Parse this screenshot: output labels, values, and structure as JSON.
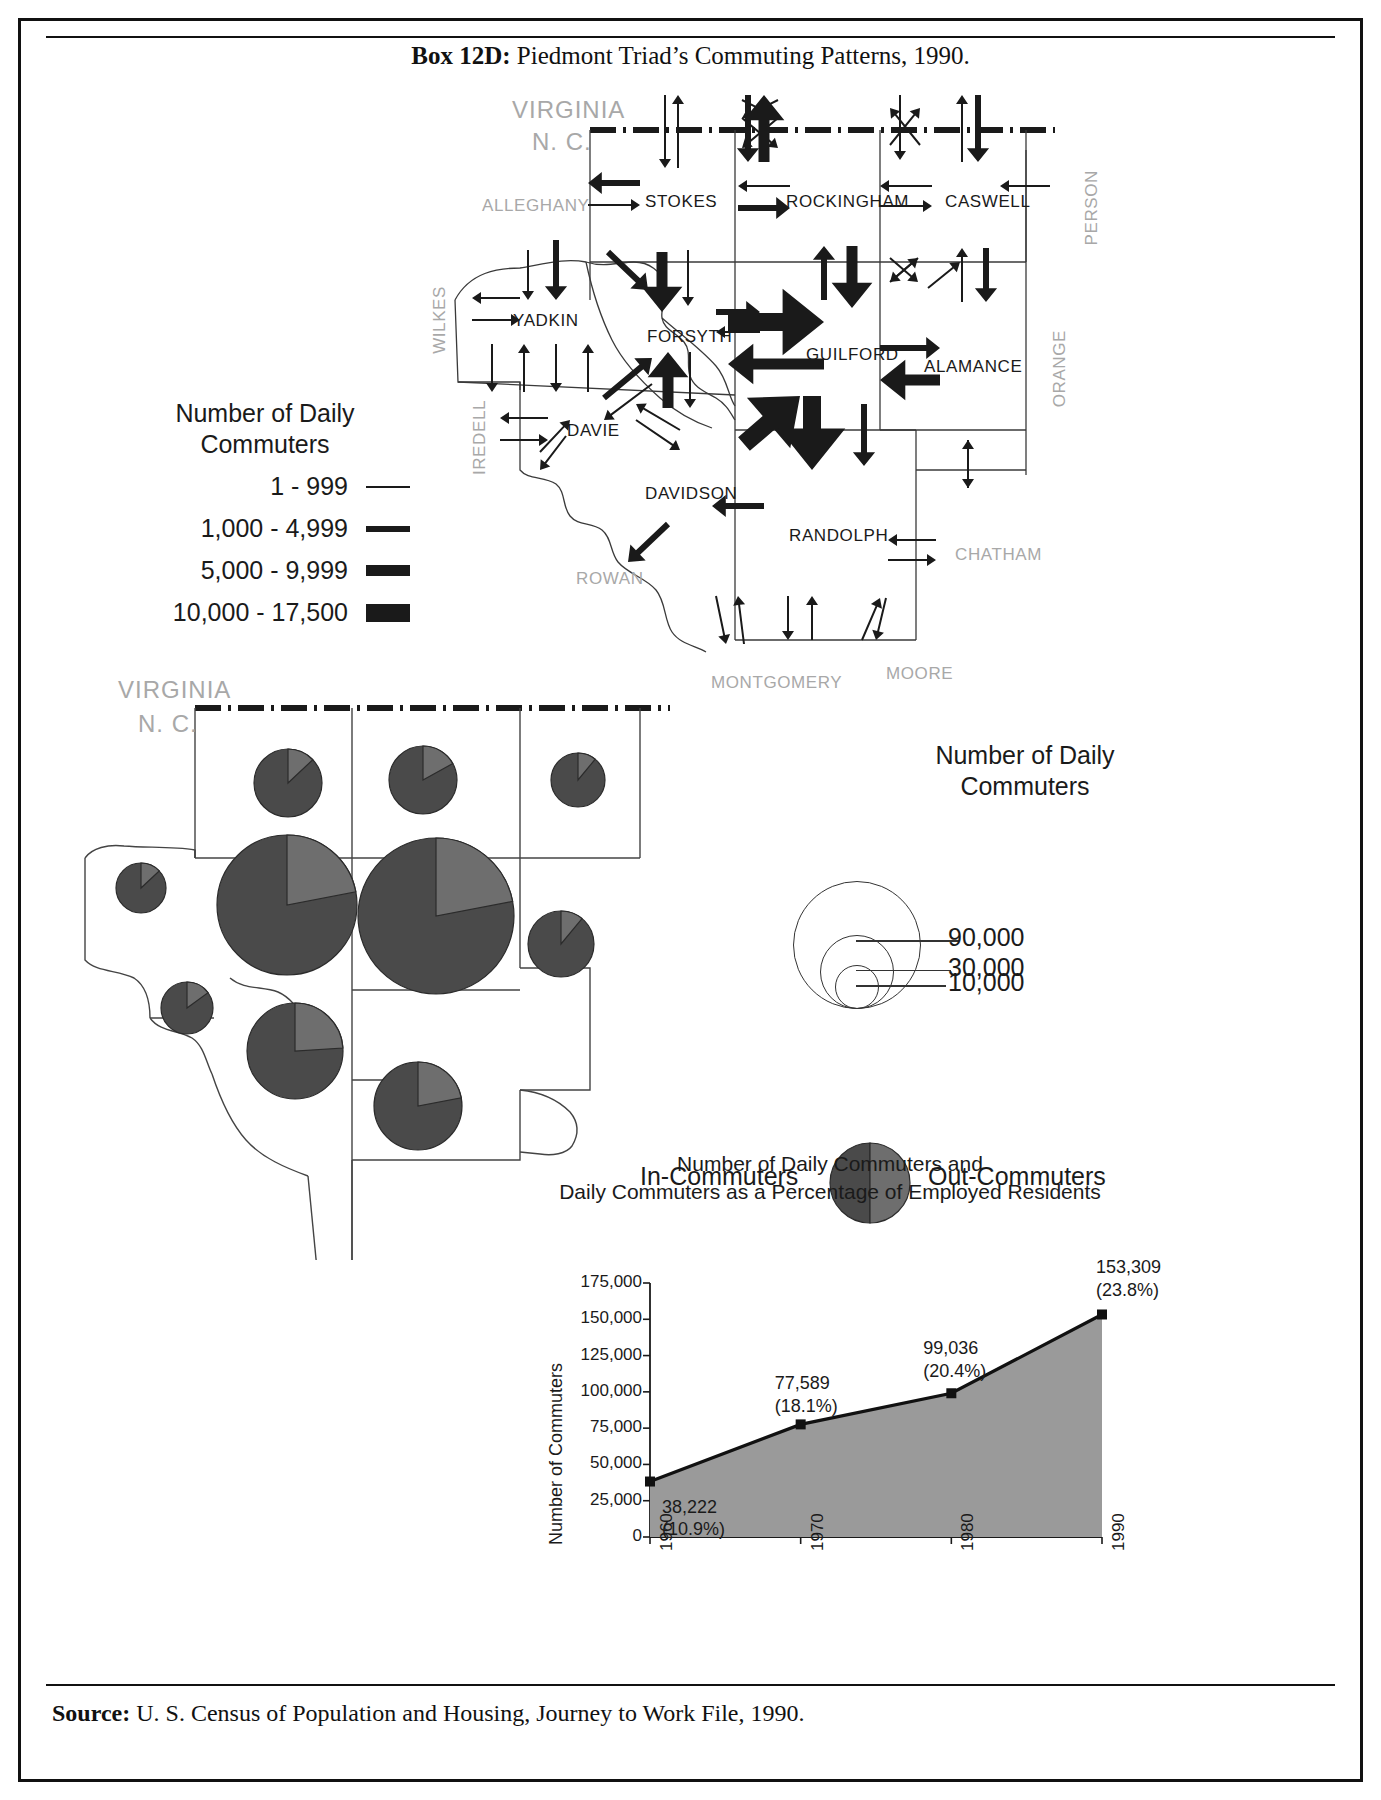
{
  "box": {
    "label": "Box 12D:",
    "title": " Piedmont Triad’s Commuting Patterns, 1990.",
    "source_label": "Source:",
    "source_text": " U. S. Census of Population and Housing, Journey to Work File, 1990."
  },
  "colors": {
    "ink": "#1a1a1a",
    "outside_county": "#a8a8a8",
    "pie_in": "#4a4a4a",
    "pie_out": "#6e6e6e",
    "area_fill": "#9a9a9a"
  },
  "flow_legend": {
    "title_line1": "Number of Daily",
    "title_line2": "Commuters",
    "classes": [
      {
        "label": "1 - 999",
        "weight_px": 2
      },
      {
        "label": "1,000 - 4,999",
        "weight_px": 6
      },
      {
        "label": "5,000 - 9,999",
        "weight_px": 11
      },
      {
        "label": "10,000 - 17,500",
        "weight_px": 18
      }
    ]
  },
  "flow_map": {
    "state_labels": {
      "above": "VIRGINIA",
      "below": "N. C."
    },
    "triad_counties": [
      {
        "name": "STOKES",
        "x": 645,
        "y": 192
      },
      {
        "name": "ROCKINGHAM",
        "x": 786,
        "y": 192
      },
      {
        "name": "CASWELL",
        "x": 945,
        "y": 192
      },
      {
        "name": "YADKIN",
        "x": 513,
        "y": 311
      },
      {
        "name": "FORSYTH",
        "x": 647,
        "y": 327
      },
      {
        "name": "GUILFORD",
        "x": 806,
        "y": 345
      },
      {
        "name": "ALAMANCE",
        "x": 924,
        "y": 357
      },
      {
        "name": "DAVIE",
        "x": 567,
        "y": 421
      },
      {
        "name": "DAVIDSON",
        "x": 645,
        "y": 484
      },
      {
        "name": "RANDOLPH",
        "x": 789,
        "y": 526
      }
    ],
    "surrounding_counties": [
      {
        "name": "ALLEGHANY",
        "x": 482,
        "y": 196,
        "vertical": false
      },
      {
        "name": "PERSON",
        "x": 1082,
        "y": 170,
        "vertical": true
      },
      {
        "name": "WILKES",
        "x": 430,
        "y": 286,
        "vertical": true
      },
      {
        "name": "ORANGE",
        "x": 1050,
        "y": 330,
        "vertical": true
      },
      {
        "name": "IREDELL",
        "x": 470,
        "y": 400,
        "vertical": true
      },
      {
        "name": "ROWAN",
        "x": 576,
        "y": 569,
        "vertical": false
      },
      {
        "name": "CHATHAM",
        "x": 955,
        "y": 545,
        "vertical": false
      },
      {
        "name": "MONTGOMERY",
        "x": 711,
        "y": 673,
        "vertical": false
      },
      {
        "name": "MOORE",
        "x": 886,
        "y": 664,
        "vertical": false
      }
    ]
  },
  "pie_map": {
    "state_labels": {
      "above": "VIRGINIA",
      "below": "N. C."
    },
    "circle_legend": {
      "title_line1": "Number of Daily",
      "title_line2": "Commuters",
      "sizes": [
        {
          "label": "90,000",
          "radius_px": 63
        },
        {
          "label": "30,000",
          "radius_px": 36
        },
        {
          "label": "10,000",
          "radius_px": 21
        }
      ]
    },
    "pie_legend": {
      "left_label": "In-Commuters",
      "right_label": "Out-Commuters"
    },
    "counties": [
      {
        "name": "STOKES",
        "cx": 288,
        "cy": 783,
        "r": 34,
        "out_share": 0.13
      },
      {
        "name": "ROCKINGHAM",
        "cx": 423,
        "cy": 780,
        "r": 34,
        "out_share": 0.17
      },
      {
        "name": "CASWELL",
        "cx": 578,
        "cy": 780,
        "r": 27,
        "out_share": 0.11
      },
      {
        "name": "YADKIN",
        "cx": 141,
        "cy": 888,
        "r": 25,
        "out_share": 0.13
      },
      {
        "name": "FORSYTH",
        "cx": 287,
        "cy": 905,
        "r": 70,
        "out_share": 0.22
      },
      {
        "name": "GUILFORD",
        "cx": 436,
        "cy": 916,
        "r": 78,
        "out_share": 0.22
      },
      {
        "name": "ALAMANCE",
        "cx": 561,
        "cy": 944,
        "r": 33,
        "out_share": 0.11
      },
      {
        "name": "DAVIE",
        "cx": 187,
        "cy": 1008,
        "r": 26,
        "out_share": 0.15
      },
      {
        "name": "DAVIDSON",
        "cx": 295,
        "cy": 1051,
        "r": 48,
        "out_share": 0.24
      },
      {
        "name": "RANDOLPH",
        "cx": 418,
        "cy": 1106,
        "r": 44,
        "out_share": 0.22
      }
    ]
  },
  "chart_data": {
    "type": "area",
    "title": "Number of Daily Commuters and\nDaily Commuters as a Percentage of Employed Residents",
    "title_line1": "Number of Daily Commuters and",
    "title_line2": "Daily Commuters as a Percentage of Employed Residents",
    "xlabel": "",
    "ylabel": "Number of Commuters",
    "x": [
      "1960",
      "1970",
      "1980",
      "1990"
    ],
    "values": [
      38222,
      77589,
      99036,
      153309
    ],
    "percentages": [
      "10.9%",
      "18.1%",
      "20.4%",
      "23.8%"
    ],
    "point_labels": [
      {
        "value": "38,222",
        "percent": "(10.9%)"
      },
      {
        "value": "77,589",
        "percent": "(18.1%)"
      },
      {
        "value": "99,036",
        "percent": "(20.4%)"
      },
      {
        "value": "153,309",
        "percent": "(23.8%)"
      }
    ],
    "ylim": [
      0,
      175000
    ],
    "yticks": [
      "0",
      "25,000",
      "50,000",
      "75,000",
      "100,000",
      "125,000",
      "150,000",
      "175,000"
    ],
    "grid": false,
    "legend": "none"
  }
}
